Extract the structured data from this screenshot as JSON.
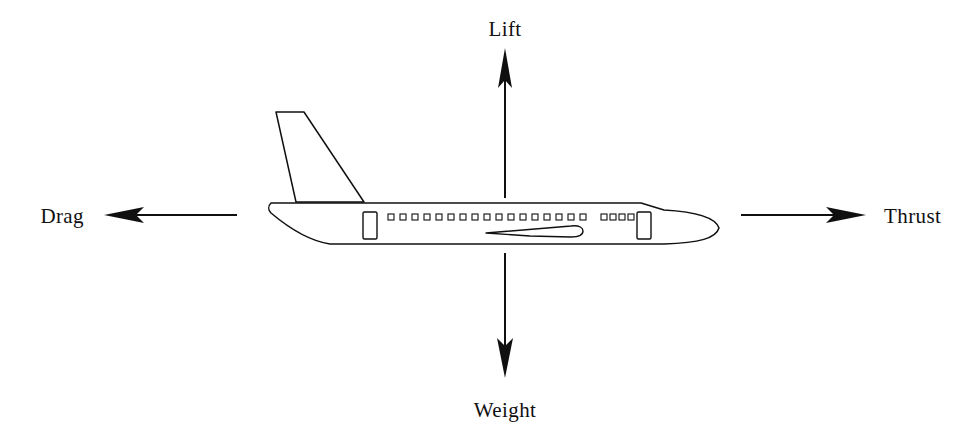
{
  "diagram": {
    "background_color": "#ffffff",
    "stroke_color": "#101010",
    "labels": {
      "lift": "Lift",
      "weight": "Weight",
      "thrust": "Thrust",
      "drag": "Drag"
    },
    "forces": [
      {
        "name": "lift",
        "label": "Lift",
        "direction": "up",
        "label_position": "top-center"
      },
      {
        "name": "weight",
        "label": "Weight",
        "direction": "down",
        "label_position": "bottom-center"
      },
      {
        "name": "thrust",
        "label": "Thrust",
        "direction": "right",
        "label_position": "right"
      },
      {
        "name": "drag",
        "label": "Drag",
        "direction": "left",
        "label_position": "left"
      }
    ],
    "aircraft": {
      "orientation": "nose-right",
      "window_count_forward_group": 6,
      "window_count_main_group": 21,
      "door_count": 2,
      "has_tail_fin": true,
      "has_wing": true
    }
  }
}
